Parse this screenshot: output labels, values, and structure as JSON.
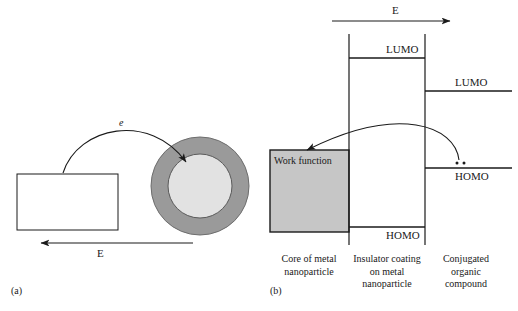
{
  "figure": {
    "type": "schematic-diagram",
    "background": "#ffffff",
    "ink_color": "#1a1a1a"
  },
  "panel_a": {
    "caption": "(a)",
    "electron_label": "e",
    "field_label": "E",
    "field_direction": "left",
    "electrode": {
      "name": "electrode-rectangle",
      "fill": "#ffffff",
      "stroke": "#1a1a1a"
    },
    "nanoparticle": {
      "shell_name": "insulator-shell",
      "shell_color": "#9a9a9a",
      "core_name": "metal-core",
      "core_color": "#e2e2e2",
      "stroke": "#555555"
    }
  },
  "panel_b": {
    "caption": "(b)",
    "field_label": "E",
    "field_direction": "right",
    "work_function_label": "Work function",
    "work_function_fill": "#c6c6c6",
    "levels": [
      {
        "name": "lumo-insulator",
        "label": "LUMO",
        "region": "insulator"
      },
      {
        "name": "lumo-organic",
        "label": "LUMO",
        "region": "organic"
      },
      {
        "name": "homo-organic",
        "label": "HOMO",
        "region": "organic"
      },
      {
        "name": "homo-insulator",
        "label": "HOMO",
        "region": "insulator"
      }
    ],
    "electron_pair_dots": 2,
    "columns": [
      {
        "name": "core-of-metal-nanoparticle",
        "line1": "Core of metal",
        "line2": "nanoparticle",
        "line3": ""
      },
      {
        "name": "insulator-coating-on-metal-nanoparticle",
        "line1": "Insulator coating",
        "line2": "on metal",
        "line3": "nanoparticle"
      },
      {
        "name": "conjugated-organic-compound",
        "line1": "Conjugated",
        "line2": "organic",
        "line3": "compound"
      }
    ]
  }
}
